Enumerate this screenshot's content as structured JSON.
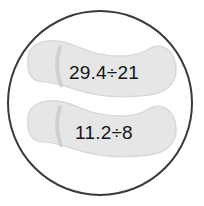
{
  "figure": {
    "kind": "circular-illustration",
    "background_color": "#ffffff"
  },
  "circle": {
    "name": "outer-circle",
    "stroke_color": "#3a3a3a",
    "fill_color": "#ffffff",
    "stroke_width": 2,
    "center_x": 100,
    "center_y": 103,
    "radius": 92
  },
  "soles": [
    {
      "id": "upper-sole",
      "label": "29.4÷21",
      "dividend": "29.4",
      "operator": "÷",
      "divisor": "21",
      "fill_color": "#e6e6e6",
      "stroke_color": "#d2d2d2",
      "text_color": "#161616",
      "text_x": 104,
      "text_y": 78
    },
    {
      "id": "lower-sole",
      "label": "11.2÷8",
      "dividend": "11.2",
      "operator": "÷",
      "divisor": "8",
      "fill_color": "#e6e6e6",
      "stroke_color": "#d2d2d2",
      "text_color": "#161616",
      "text_x": 104,
      "text_y": 138
    }
  ]
}
